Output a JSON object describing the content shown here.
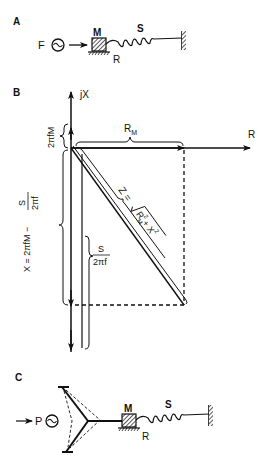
{
  "panels": {
    "a": {
      "label": "A",
      "force_label": "F",
      "mass_label": "M",
      "spring_label": "S",
      "resistance_label": "R"
    },
    "b": {
      "label": "B",
      "y_axis_label": "jX",
      "x_axis_label": "R",
      "rm_label": "R",
      "rm_sub": "M",
      "mass_reactance_label": "2πfM",
      "net_reactance_label": "X = 2πfM − S/2πf",
      "net_reactance_num": "S",
      "net_reactance_den": "2πf",
      "net_reactance_prefix": "X = 2πfM −",
      "stiffness_num": "S",
      "stiffness_den": "2πf",
      "impedance_label": "Z =",
      "impedance_expr_r": "R",
      "impedance_expr_rsub": "M",
      "impedance_expr_x": "+ X",
      "sup2": "2"
    },
    "c": {
      "label": "C",
      "pressure_label": "P",
      "mass_label": "M",
      "spring_label": "S",
      "resistance_label": "R"
    }
  },
  "colors": {
    "ink": "#111111",
    "background": "#ffffff"
  }
}
